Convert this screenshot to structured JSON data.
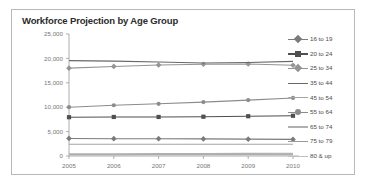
{
  "chart_data": {
    "type": "line",
    "title": "Workforce Projection by Age Group",
    "xlabel": "",
    "ylabel": "",
    "x": [
      "2005",
      "2006",
      "2007",
      "2008",
      "2009",
      "2010"
    ],
    "categories": [
      "2005",
      "2006",
      "2007",
      "2008",
      "2009",
      "2010"
    ],
    "ylim": [
      0,
      25000
    ],
    "yticks": [
      0,
      5000,
      10000,
      15000,
      20000,
      25000
    ],
    "ytick_labels": [
      "0",
      "5,000",
      "10,000",
      "15,000",
      "20,000",
      "25,000"
    ],
    "grid": false,
    "legend_position": "right",
    "series": [
      {
        "name": "16 to 19",
        "values": [
          3600,
          3550,
          3550,
          3500,
          3450,
          3400
        ],
        "color": "#7b7b7b",
        "marker": "diamond"
      },
      {
        "name": "20 to 24",
        "values": [
          7950,
          8000,
          8000,
          8050,
          8150,
          8250
        ],
        "color": "#4f4f4f",
        "marker": "square"
      },
      {
        "name": "25 to 34",
        "values": [
          18000,
          18350,
          18650,
          18800,
          18850,
          18600
        ],
        "color": "#949494",
        "marker": "diamond"
      },
      {
        "name": "35 to 44",
        "values": [
          19550,
          19450,
          19250,
          19050,
          19150,
          19400
        ],
        "color": "#686868",
        "marker": "none"
      },
      {
        "name": "45 to 54",
        "values": [
          2400,
          2400,
          2400,
          2400,
          2400,
          2400
        ],
        "color": "#a5a5a5",
        "marker": "none"
      },
      {
        "name": "55 to 64",
        "values": [
          10000,
          10400,
          10700,
          11050,
          11450,
          11900
        ],
        "color": "#8c8c8c",
        "marker": "circle"
      },
      {
        "name": "65 to 74",
        "values": [
          450,
          470,
          490,
          510,
          530,
          550
        ],
        "color": "#b0b0b0",
        "marker": "none"
      },
      {
        "name": "75 to 79",
        "values": [
          300,
          305,
          310,
          315,
          320,
          325
        ],
        "color": "#9a9a9a",
        "marker": "none"
      },
      {
        "name": "80 & up",
        "values": [
          180,
          185,
          190,
          195,
          200,
          205
        ],
        "color": "#c0c0c0",
        "marker": "none"
      }
    ]
  },
  "colors": {
    "frame_border": "#b9b9b9",
    "axis": "#9a9a9a",
    "tick_text": "#777777",
    "title_text": "#2b2b2b"
  }
}
